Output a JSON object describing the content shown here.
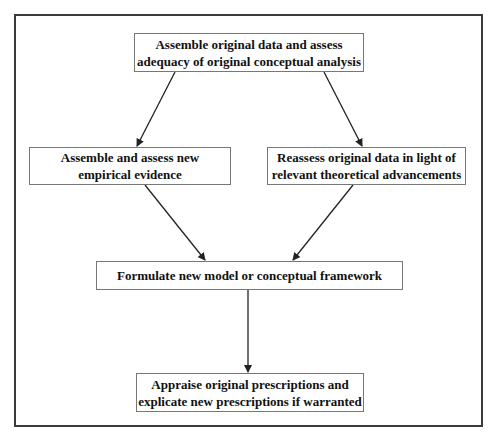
{
  "diagram": {
    "type": "flowchart",
    "nodes": [
      {
        "id": "n1",
        "lines": [
          "Assemble original data and assess",
          "adequacy of original conceptual analysis"
        ]
      },
      {
        "id": "n2",
        "lines": [
          "Assemble and assess new",
          "empirical evidence"
        ]
      },
      {
        "id": "n3",
        "lines": [
          "Reassess original data in light of",
          "relevant theoretical advancements"
        ]
      },
      {
        "id": "n4",
        "lines": [
          "Formulate new model or conceptual framework"
        ]
      },
      {
        "id": "n5",
        "lines": [
          "Appraise original prescriptions and",
          "explicate new prescriptions if warranted"
        ]
      }
    ],
    "edges": [
      {
        "from": "n1",
        "to": "n2"
      },
      {
        "from": "n1",
        "to": "n3"
      },
      {
        "from": "n2",
        "to": "n4"
      },
      {
        "from": "n3",
        "to": "n4"
      },
      {
        "from": "n4",
        "to": "n5"
      }
    ],
    "colors": {
      "frame": "#3a3a3a",
      "box_border": "#777777",
      "arrow": "#222222",
      "text": "#111111",
      "background": "#ffffff"
    }
  }
}
